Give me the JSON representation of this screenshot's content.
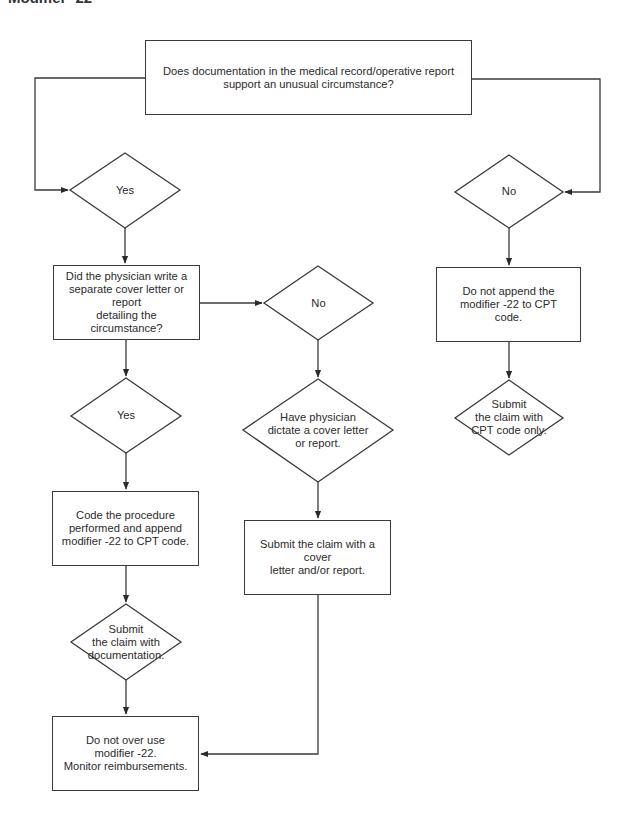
{
  "page_title": "Modifier -22",
  "colors": {
    "line": "#3a3a3a",
    "text": "#2b2b2b",
    "background": "#ffffff"
  },
  "nodes": {
    "start_question": "Does documentation in the medical record/operative report\nsupport an unusual circumstance?",
    "yes_1": "Yes",
    "no_1": "No",
    "cover_letter_question": "Did the physician write a\nseparate cover letter or report\ndetailing the circumstance?",
    "no_2": "No",
    "yes_2": "Yes",
    "have_physician_dictate": "Have physician\ndictate a cover letter\nor report.",
    "submit_with_cover_letter": "Submit the claim with a cover\nletter and/or report.",
    "code_procedure": "Code the procedure\nperformed and append\nmodifier -22 to CPT code.",
    "submit_with_documentation": "Submit\nthe claim with\ndocumentation.",
    "do_not_overuse": "Do not over use\nmodifier -22.\nMonitor reimbursements.",
    "do_not_append": "Do not append the\nmodifier -22 to CPT code.",
    "submit_cpt_only": "Submit\nthe claim with\nCPT code only."
  }
}
